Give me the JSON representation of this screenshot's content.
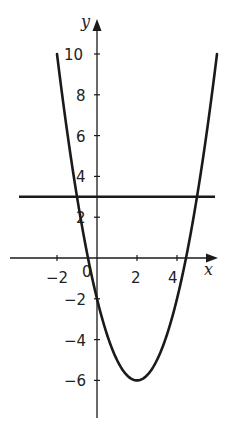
{
  "chart_data": {
    "type": "line",
    "title": "",
    "xlabel": "x",
    "ylabel": "y",
    "xlim": [
      -3.9,
      6.0
    ],
    "ylim": [
      -7.8,
      11.5
    ],
    "grid": false,
    "x_ticks": [
      -2,
      0,
      2,
      4
    ],
    "x_tick_labels": [
      "−2",
      "0",
      "2",
      "4"
    ],
    "y_ticks": [
      -6,
      -4,
      -2,
      2,
      4,
      6,
      8,
      10
    ],
    "y_tick_labels": [
      "−6",
      "−4",
      "−2",
      "2",
      "4",
      "6",
      "8",
      "10"
    ],
    "series": [
      {
        "name": "y = x² − 4x − 2",
        "kind": "curve",
        "x": [
          -2,
          -1,
          0,
          1,
          2,
          3,
          4,
          5,
          6
        ],
        "y": [
          10,
          3,
          -2,
          -5,
          -6,
          -5,
          -2,
          3,
          10
        ]
      },
      {
        "name": "y = 3",
        "kind": "horizontal-line",
        "x": [
          -3.9,
          5.9
        ],
        "y": [
          3,
          3
        ]
      }
    ],
    "annotations": []
  },
  "labels": {
    "x_axis": "x",
    "y_axis": "y",
    "origin": "0",
    "xt_m2": "−2",
    "xt_2": "2",
    "xt_4": "4",
    "yt_10": "10",
    "yt_8": "8",
    "yt_6": "6",
    "yt_4": "4",
    "yt_2": "2",
    "yt_m2": "−2",
    "yt_m4": "−4",
    "yt_m6": "−6"
  },
  "colors": {
    "ink": "#1a1a1a",
    "background": "#ffffff"
  }
}
